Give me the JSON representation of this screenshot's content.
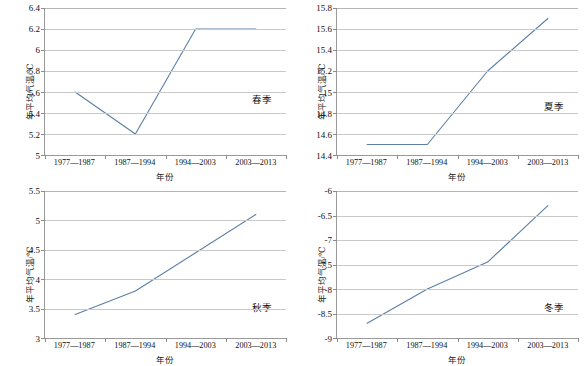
{
  "figure": {
    "caption": "",
    "line_color": "#5b7fa6",
    "grid_color": "#c9c9c9",
    "axis_color": "#9a9a9a"
  },
  "axis_titles": {
    "x": "年份",
    "y": "年平均气温/℃"
  },
  "categories": [
    "1977—1987",
    "1987—1994",
    "1994—2003",
    "2003—2013"
  ],
  "chart_data": [
    {
      "type": "line",
      "title": "春季",
      "season_label": "春季",
      "categories": [
        "1977—1987",
        "1987—1994",
        "1994—2003",
        "2003—2013"
      ],
      "values": [
        5.6,
        5.2,
        6.2,
        6.2
      ],
      "xlabel": "年份",
      "ylabel": "年平均气温/℃",
      "ylim": [
        5,
        6.4
      ],
      "ytick_step": 0.2,
      "yticks": [
        "5",
        "5.2",
        "5.4",
        "5.6",
        "5.8",
        "6",
        "6.2",
        "6.4"
      ],
      "ytick_values": [
        5,
        5.2,
        5.4,
        5.6,
        5.8,
        6,
        6.2,
        6.4
      ],
      "grid": true,
      "legend": "none"
    },
    {
      "type": "line",
      "title": "夏季",
      "season_label": "夏季",
      "categories": [
        "1977—1987",
        "1987—1994",
        "1994—2003",
        "2003—2013"
      ],
      "values": [
        14.5,
        14.5,
        15.2,
        15.7
      ],
      "xlabel": "年份",
      "ylabel": "年平均气温/℃",
      "ylim": [
        14.4,
        15.8
      ],
      "ytick_step": 0.2,
      "yticks": [
        "14.4",
        "14.6",
        "14.8",
        "15",
        "15.2",
        "15.4",
        "15.6",
        "15.8"
      ],
      "ytick_values": [
        14.4,
        14.6,
        14.8,
        15,
        15.2,
        15.4,
        15.6,
        15.8
      ],
      "grid": true,
      "legend": "none"
    },
    {
      "type": "line",
      "title": "秋季",
      "season_label": "秋季",
      "categories": [
        "1977—1987",
        "1987—1994",
        "1994—2003",
        "2003—2013"
      ],
      "values": [
        3.4,
        3.8,
        4.45,
        5.1
      ],
      "xlabel": "年份",
      "ylabel": "年平均气温/℃",
      "ylim": [
        3,
        5.5
      ],
      "ytick_step": 0.5,
      "yticks": [
        "3",
        "3.5",
        "4",
        "4.5",
        "5",
        "5.5"
      ],
      "ytick_values": [
        3,
        3.5,
        4,
        4.5,
        5,
        5.5
      ],
      "grid": true,
      "legend": "none"
    },
    {
      "type": "line",
      "title": "冬季",
      "season_label": "冬季",
      "categories": [
        "1977—1987",
        "1987—1994",
        "1994—2003",
        "2003—2013"
      ],
      "values": [
        -8.7,
        -8.0,
        -7.45,
        -6.3
      ],
      "xlabel": "年份",
      "ylabel": "年平均气温/℃",
      "ylim": [
        -9,
        -6
      ],
      "ytick_step": 0.5,
      "yticks": [
        "-9",
        "-8.5",
        "-8",
        "-7.5",
        "-7",
        "-6.5",
        "-6"
      ],
      "ytick_values": [
        -9,
        -8.5,
        -8,
        -7.5,
        -7,
        -6.5,
        -6
      ],
      "grid": true,
      "legend": "none"
    }
  ]
}
